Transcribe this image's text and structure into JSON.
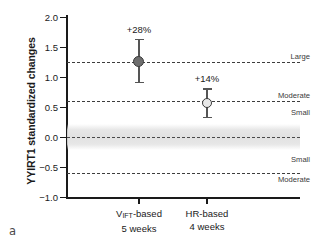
{
  "panel": {
    "label": "a"
  },
  "chart_data": {
    "type": "scatter",
    "title": "",
    "xlabel": "",
    "ylabel": "YYIRT1 standardized changes",
    "ylim": [
      -1.0,
      2.0
    ],
    "yticks": [
      "2.0",
      "1.5",
      "1.0",
      "0.5",
      "0.0",
      "-0.5",
      "-1.0"
    ],
    "ytick_values": [
      2.0,
      1.5,
      1.0,
      0.5,
      0.0,
      -0.5,
      -1.0
    ],
    "categories": [
      "V_IFT-based 5 weeks",
      "HR-based 4 weeks"
    ],
    "grid": false,
    "legend": "none",
    "series": [
      {
        "name": "Standardized change",
        "points": [
          {
            "category": "VIFT-based",
            "label_line1": "V",
            "label_sub": "IFT",
            "label_line1_rest": "-based",
            "label_line2": "5 weeks",
            "value": 1.25,
            "ci_low": 0.91,
            "ci_high": 1.62,
            "annotation": "+28%",
            "marker": "filled-circle"
          },
          {
            "category": "HR-based",
            "label_line1": "HR-based",
            "label_sub": "",
            "label_line1_rest": "",
            "label_line2": "4 weeks",
            "value": 0.57,
            "ci_low": 0.32,
            "ci_high": 0.8,
            "annotation": "+14%",
            "marker": "open-circle"
          }
        ]
      }
    ],
    "threshold_lines": [
      {
        "value": 1.25,
        "label": "Large",
        "label_side": "above"
      },
      {
        "value": 0.6,
        "label": "Moderate",
        "label_side": "above"
      },
      {
        "value": 0.0,
        "label": "",
        "label_side": "none"
      },
      {
        "value": -0.6,
        "label": "",
        "label_side": "none"
      }
    ],
    "zone_labels": [
      {
        "label": "Large",
        "value": 1.33
      },
      {
        "label": "Moderate",
        "value": 0.68
      },
      {
        "label": "Small",
        "value": 0.4
      },
      {
        "label": "Small",
        "value": -0.38
      },
      {
        "label": "Moderate",
        "value": -0.72
      }
    ],
    "shaded_band": {
      "low": -0.22,
      "high": 0.22,
      "meaning": "trivial"
    },
    "colors": {
      "axis": "#1a1a1a",
      "marker_fill": "#6e6e6e",
      "marker_open_fill": "#e8e8e8",
      "marker_edge": "#3a3a3a",
      "error_bar": "#555555",
      "dashed_line": "#3d3d3d",
      "band": "#e4e4e4",
      "text": "#1a1a1a",
      "zone_text": "#3a3a3a"
    }
  }
}
